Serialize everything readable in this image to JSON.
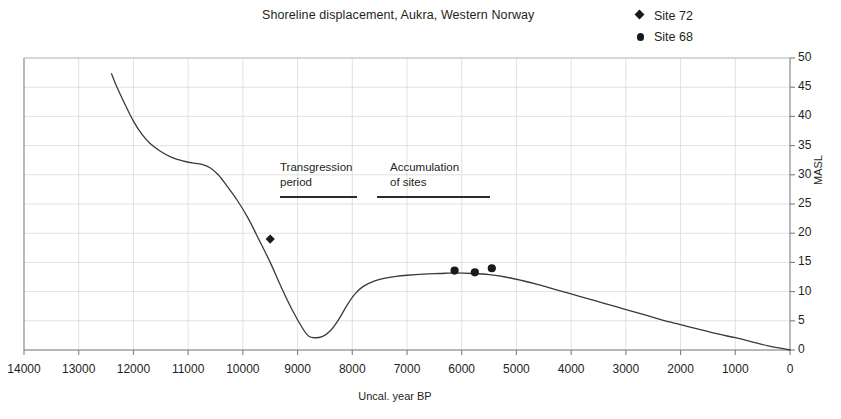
{
  "chart_data": {
    "type": "line",
    "title": "Shoreline displacement, Aukra, Western Norway",
    "xlabel": "Uncal. year BP",
    "ylabel": "MASL",
    "xlim": [
      14000,
      0
    ],
    "ylim": [
      0,
      50
    ],
    "x_reversed": true,
    "grid": true,
    "legend_position": "top-right",
    "xticks": [
      14000,
      13000,
      12000,
      11000,
      10000,
      9000,
      8000,
      7000,
      6000,
      5000,
      4000,
      3000,
      2000,
      1000,
      0
    ],
    "xtick_labels": [
      "14000",
      "13000",
      "12000",
      "11000",
      "10000",
      "9000",
      "8000",
      "7000",
      "6000",
      "5000",
      "4000",
      "3000",
      "2000",
      "1000",
      "0"
    ],
    "yticks": [
      0,
      5,
      10,
      15,
      20,
      25,
      30,
      35,
      40,
      45,
      50
    ],
    "ytick_labels": [
      "0",
      "5",
      "10",
      "15",
      "20",
      "25",
      "30",
      "35",
      "40",
      "45",
      "50"
    ],
    "series": [
      {
        "name": "Shoreline displacement curve",
        "type": "line",
        "color": "#3a3a3a",
        "x": [
          12400,
          12300,
          12150,
          12000,
          11850,
          11700,
          11500,
          11300,
          11100,
          10900,
          10750,
          10600,
          10450,
          10300,
          10100,
          9900,
          9700,
          9500,
          9300,
          9100,
          8900,
          8800,
          8700,
          8550,
          8400,
          8250,
          8100,
          7950,
          7800,
          7600,
          7400,
          7200,
          7000,
          6700,
          6400,
          6100,
          5800,
          5500,
          5200,
          4900,
          4600,
          4300,
          4000,
          3700,
          3400,
          3100,
          2800,
          2500,
          2200,
          1900,
          1600,
          1300,
          1000,
          700,
          400,
          200,
          0
        ],
        "y": [
          47.3,
          45.0,
          42.0,
          39.2,
          37.0,
          35.4,
          34.0,
          33.0,
          32.4,
          32.0,
          31.8,
          31.2,
          30.0,
          28.2,
          25.6,
          22.5,
          18.8,
          15.0,
          10.8,
          6.9,
          3.6,
          2.4,
          2.1,
          2.3,
          3.3,
          5.2,
          7.6,
          9.6,
          10.9,
          11.8,
          12.3,
          12.6,
          12.8,
          13.0,
          13.1,
          13.2,
          13.1,
          12.9,
          12.5,
          11.9,
          11.2,
          10.4,
          9.6,
          8.8,
          8.0,
          7.2,
          6.4,
          5.6,
          4.8,
          4.1,
          3.4,
          2.7,
          2.1,
          1.4,
          0.7,
          0.35,
          0.0
        ]
      },
      {
        "name": "Site 72",
        "type": "scatter",
        "marker": "diamond",
        "color": "#1a1a1a",
        "points": [
          {
            "x": 9500,
            "y": 19.0
          }
        ]
      },
      {
        "name": "Site 68",
        "type": "scatter",
        "marker": "circle",
        "color": "#1a1a1a",
        "points": [
          {
            "x": 6130,
            "y": 13.6
          },
          {
            "x": 5760,
            "y": 13.3
          },
          {
            "x": 5450,
            "y": 14.0
          }
        ]
      }
    ],
    "annotations": [
      {
        "id": "transgression",
        "lines": [
          "Transgression",
          "period"
        ],
        "text": "Transgression period",
        "bar_x_range": [
          9550,
          8200
        ]
      },
      {
        "id": "accumulation",
        "lines": [
          "Accumulation",
          "of sites"
        ],
        "text": "Accumulation of sites",
        "bar_x_range": [
          7850,
          5900
        ]
      }
    ]
  },
  "legend": {
    "items": [
      {
        "label": "Site 72",
        "marker": "diamond"
      },
      {
        "label": "Site 68",
        "marker": "circle"
      }
    ]
  }
}
